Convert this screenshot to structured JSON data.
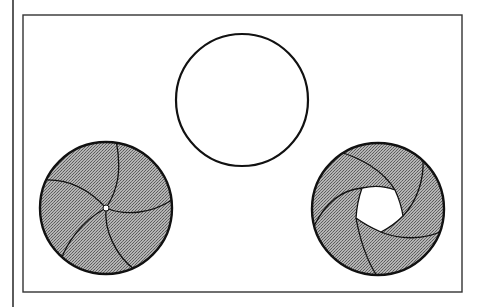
{
  "diagram": {
    "title": "Iris diaphragm aperture states",
    "colors": {
      "background": "#ffffff",
      "stroke": "#111111",
      "frame": "#333333",
      "blade_fill": "#a8a8a8",
      "blade_dot": "#6a6a6a",
      "opening": "#ffffff"
    },
    "side_rule": {
      "x": 13,
      "y1": 0,
      "y2": 307
    },
    "frame": {
      "x": 23,
      "y": 15,
      "width": 439,
      "height": 277
    },
    "apertures": [
      {
        "id": "open",
        "label": "Fully open aperture",
        "cx": 242,
        "cy": 100,
        "r": 66,
        "blades": 0,
        "opening_radius": 66
      },
      {
        "id": "closed",
        "label": "Nearly closed aperture",
        "cx": 106,
        "cy": 208,
        "r": 66,
        "blades": 5,
        "opening_radius": 3
      },
      {
        "id": "partial",
        "label": "Partially open aperture",
        "cx": 378,
        "cy": 209,
        "r": 66,
        "blades": 5,
        "opening_radius": 22
      }
    ]
  }
}
